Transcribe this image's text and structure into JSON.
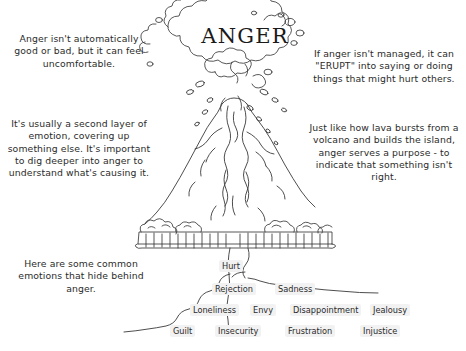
{
  "poster": {
    "title": "ANGER",
    "width": 466,
    "height": 351,
    "ink_color": "#2b2b2b",
    "background_color": "#ffffff"
  },
  "left_column": {
    "paragraph_1": "Anger isn't automatically good or bad, but it can feel uncomfortable.",
    "paragraph_2": "It's usually a second layer of emotion, covering up something else. It's important to dig deeper into anger to understand what's causing it.",
    "paragraph_3": "Here are some common emotions that hide behind anger."
  },
  "right_column": {
    "paragraph_1": "If anger isn't managed, it can \"ERUPT\" into saying or doing things that might hurt others.",
    "paragraph_2": "Just like how lava bursts from a volcano and builds the island, anger serves a purpose - to indicate that something isn't right."
  },
  "hidden_emotions": [
    {
      "label": "Hurt",
      "x": 219,
      "y": 260
    },
    {
      "label": "Rejection",
      "x": 212,
      "y": 283
    },
    {
      "label": "Sadness",
      "x": 275,
      "y": 283
    },
    {
      "label": "Loneliness",
      "x": 190,
      "y": 304
    },
    {
      "label": "Envy",
      "x": 250,
      "y": 304
    },
    {
      "label": "Disappointment",
      "x": 290,
      "y": 304
    },
    {
      "label": "Jealousy",
      "x": 370,
      "y": 304
    },
    {
      "label": "Guilt",
      "x": 170,
      "y": 325
    },
    {
      "label": "Insecurity",
      "x": 215,
      "y": 325
    },
    {
      "label": "Frustration",
      "x": 285,
      "y": 325
    },
    {
      "label": "Injustice",
      "x": 360,
      "y": 325
    }
  ],
  "illustration": {
    "name": "erupting-volcano-line-drawing",
    "parts": [
      "smoke-cloud",
      "lava-spray",
      "volcano-cone",
      "lava-flows",
      "rocky-ground-band",
      "magma-tube",
      "underground-chamber-line"
    ]
  }
}
